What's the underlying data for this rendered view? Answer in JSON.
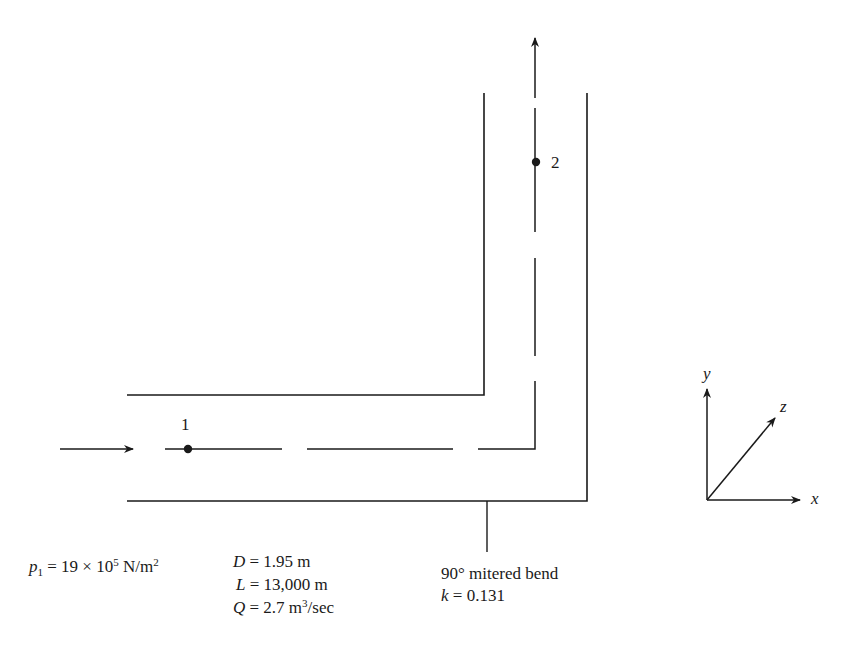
{
  "diagram": {
    "stroke_color": "#1a1a1a",
    "points": [
      {
        "id": "point-1",
        "label": "1"
      },
      {
        "id": "point-2",
        "label": "2"
      }
    ],
    "inlet": {
      "p_symbol": "p",
      "p_subscript": "1",
      "p_value": " = 19 × 10",
      "p_exponent": "5",
      "p_unit": " N/m",
      "p_unit_exponent": "2"
    },
    "pipe_properties": {
      "D_symbol": "D",
      "D_value": " = 1.95 m",
      "L_symbol": "L",
      "L_value": " = 13,000 m",
      "Q_symbol": "Q",
      "Q_value": " = 2.7 m",
      "Q_exponent": "3",
      "Q_unit_tail": "/sec"
    },
    "bend": {
      "label": "90° mitered bend",
      "k_symbol": "k",
      "k_value": " = 0.131"
    },
    "axes": {
      "x": "x",
      "y": "y",
      "z": "z"
    }
  }
}
